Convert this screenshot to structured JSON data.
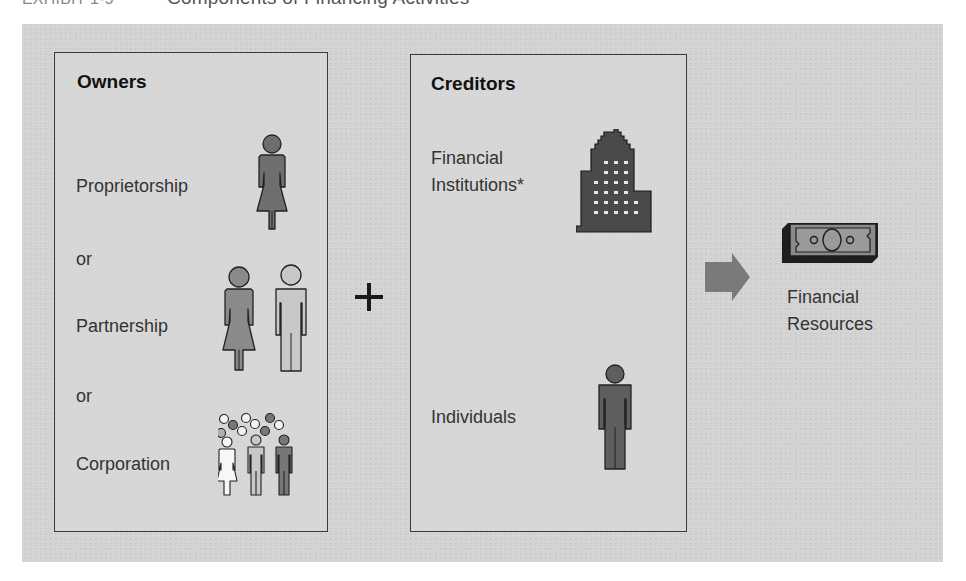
{
  "header": {
    "exhibit": "EXHIBIT 1-5",
    "title": "Components of Financing Activities"
  },
  "owners": {
    "title": "Owners",
    "items": [
      {
        "label": "Proprietorship",
        "icon": "single-woman-icon"
      },
      {
        "connector": "or"
      },
      {
        "label": "Partnership",
        "icon": "woman-and-man-icon"
      },
      {
        "connector": "or"
      },
      {
        "label": "Corporation",
        "icon": "crowd-icon"
      }
    ]
  },
  "operator": "+",
  "creditors": {
    "title": "Creditors",
    "items": [
      {
        "label_line1": "Financial",
        "label_line2": "Institutions*",
        "icon": "office-building-icon"
      },
      {
        "label": "Individuals",
        "icon": "man-icon"
      }
    ]
  },
  "result": {
    "arrow": "right-arrow-icon",
    "icon": "dollar-bill-icon",
    "label_line1": "Financial",
    "label_line2": "Resources"
  },
  "colors": {
    "background": "#d3d3d3",
    "box_border": "#3a3a3a",
    "icon_dark": "#4a4a4a",
    "icon_medium": "#6e6e6e",
    "icon_light": "#b9b9b9",
    "arrow": "#7a7a7a"
  }
}
